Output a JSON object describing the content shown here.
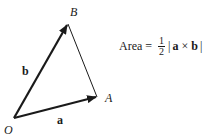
{
  "diagram": {
    "points": {
      "O": {
        "label": "O",
        "x": 14,
        "y": 118
      },
      "A": {
        "label": "A",
        "x": 97,
        "y": 97
      },
      "B": {
        "label": "B",
        "x": 68,
        "y": 24
      }
    },
    "vectors": [
      {
        "name": "a",
        "label": "a",
        "from": "O",
        "to": "A"
      },
      {
        "name": "b",
        "label": "b",
        "from": "O",
        "to": "B"
      }
    ],
    "segments": [
      {
        "from": "A",
        "to": "B"
      }
    ]
  },
  "formula": {
    "lhs": "Area",
    "equals": "=",
    "frac_num": "1",
    "frac_den": "2",
    "bar_open": "|",
    "vec_a": "a",
    "times": "×",
    "vec_b": "b",
    "bar_close": "|"
  },
  "colors": {
    "ink": "#1a1a1a",
    "background": "#ffffff"
  }
}
